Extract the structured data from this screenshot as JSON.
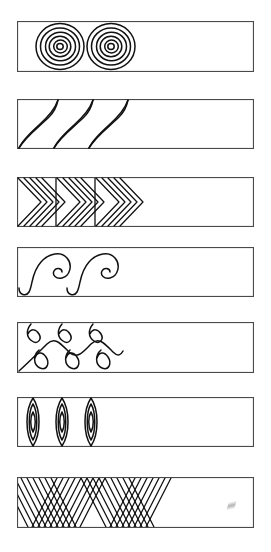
{
  "figure": {
    "type": "ornament-plate",
    "background_color": "#ffffff",
    "line_color": "#111111",
    "frame_color": "#4a4a4a",
    "band_count": 7,
    "canvas": {
      "width": 271,
      "height": 552
    }
  },
  "bands": [
    {
      "index": 1,
      "motif_name": "concentric-spirals",
      "motif_label": "Concentric spiral roundels",
      "repeat_count": 2,
      "fill_fraction": 0.42,
      "x": 17,
      "y": 21,
      "width": 237,
      "height": 51
    },
    {
      "index": 2,
      "motif_name": "s-curve-leaves",
      "motif_label": "S-curve flame leaves",
      "repeat_count": 3,
      "fill_fraction": 0.45,
      "x": 17,
      "y": 99,
      "width": 237,
      "height": 50
    },
    {
      "index": 3,
      "motif_name": "nested-chevrons",
      "motif_label": "Nested chevrons in compartments",
      "repeat_count": 3,
      "fill_fraction": 0.46,
      "x": 17,
      "y": 177,
      "width": 237,
      "height": 50
    },
    {
      "index": 4,
      "motif_name": "spiral-scrolls",
      "motif_label": "Running spiral scrolls",
      "repeat_count": 2,
      "fill_fraction": 0.45,
      "x": 17,
      "y": 247,
      "width": 237,
      "height": 50
    },
    {
      "index": 5,
      "motif_name": "interlocking-loops",
      "motif_label": "Interlocking figure-eight loops",
      "repeat_count": 3,
      "fill_fraction": 0.45,
      "x": 17,
      "y": 322,
      "width": 237,
      "height": 51
    },
    {
      "index": 6,
      "motif_name": "nested-vesicas",
      "motif_label": "Nested pointed ovals",
      "repeat_count": 3,
      "fill_fraction": 0.36,
      "x": 17,
      "y": 397,
      "width": 237,
      "height": 50
    },
    {
      "index": 7,
      "motif_name": "nested-zigzags",
      "motif_label": "Dense nested zigzag chevrons",
      "repeat_count": 4,
      "fill_fraction": 0.62,
      "x": 17,
      "y": 477,
      "width": 237,
      "height": 51
    }
  ],
  "artifacts": [
    {
      "name": "pencil-smudge",
      "x": 228,
      "y": 500
    }
  ]
}
